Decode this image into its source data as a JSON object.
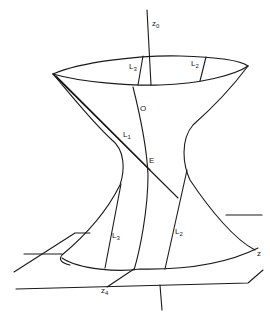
{
  "figure": {
    "stroke_color": "#1a1a1a",
    "background": "#ffffff"
  },
  "labels": {
    "z0": {
      "main": "z",
      "sub": "0",
      "x": 152,
      "y": 24
    },
    "L3_top": {
      "main": "L",
      "sub": "3",
      "x": 130,
      "y": 67
    },
    "L2_top": {
      "main": "L",
      "sub": "2",
      "x": 191,
      "y": 63
    },
    "O": {
      "main": "O",
      "sub": "",
      "x": 140,
      "y": 108
    },
    "L1": {
      "main": "L",
      "sub": "1",
      "x": 123,
      "y": 134
    },
    "E": {
      "main": "E",
      "sub": "",
      "x": 149,
      "y": 160
    },
    "L3_bottom": {
      "main": "L",
      "sub": "3",
      "x": 112,
      "y": 234
    },
    "L2_bottom": {
      "main": "L",
      "sub": "2",
      "x": 175,
      "y": 230
    },
    "z": {
      "main": "z",
      "sub": "",
      "x": 258,
      "y": 252
    },
    "z4": {
      "main": "z",
      "sub": "4",
      "x": 101,
      "y": 289
    }
  },
  "paths": {
    "top_ellipse_back": "M53,74 C80,62 140,55 180,56 C215,57 240,60 248,66",
    "top_ellipse_front": "M53,74 C80,82 130,86 160,85 C200,84 235,75 248,66",
    "left_profile": "M53,74 C75,100 95,125 112,140 C125,150 125,170 120,185 C105,215 80,240 62,255 C58,260 62,263 70,265",
    "right_profile": "M248,66 C230,90 210,110 193,125 C180,140 183,165 190,180 C210,210 235,240 255,250",
    "bottom_curve": "M62,258 C80,270 120,272 140,269 C190,270 230,262 258,248",
    "z0_axis": "M147,10 L151,85",
    "L3_top_line": "M143,56 L138,85",
    "L2_top_line": "M206,57 L200,81",
    "O_line": "M133,87 C140,115 147,150 148,175 C148,210 140,250 134,270",
    "L1_line_a": "M53,74 L178,198",
    "L1_line_b": "M56,76 L150,170",
    "L3_bottom_line": "M121,184 L105,268",
    "L2_bottom_line": "M187,170 L165,269",
    "shelf_left": "M14,272 L75,233 L90,233",
    "shelf_left_low": "M24,254 L62,254",
    "shelf_right": "M226,215 L262,215",
    "bottom_axis": "M134,269 L107,287",
    "front_shelf": "M16,289 L248,283 L263,270",
    "vertical_bottom": "M160,285 L162,310"
  }
}
